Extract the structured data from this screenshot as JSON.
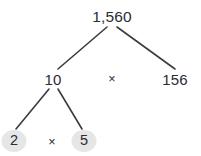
{
  "diagram": {
    "type": "factor-tree",
    "background_color": "#ffffff",
    "line_color": "#3a3a42",
    "text_color": "#2b2b33",
    "leaf_circle_color": "#e6e6e6",
    "nodes": [
      {
        "id": "root",
        "label": "1,560",
        "x": 112,
        "y": 17,
        "style": "plain"
      },
      {
        "id": "ten",
        "label": "10",
        "x": 53,
        "y": 79,
        "style": "plain"
      },
      {
        "id": "mid_op",
        "label": "×",
        "x": 112,
        "y": 79,
        "style": "operator"
      },
      {
        "id": "n156",
        "label": "156",
        "x": 175,
        "y": 79,
        "style": "plain"
      },
      {
        "id": "two",
        "label": "2",
        "x": 14,
        "y": 141,
        "style": "circled"
      },
      {
        "id": "low_op",
        "label": "×",
        "x": 52,
        "y": 142,
        "style": "operator"
      },
      {
        "id": "five",
        "label": "5",
        "x": 84,
        "y": 141,
        "style": "circled"
      }
    ],
    "edges": [
      {
        "id": "root-ten",
        "from": "root",
        "to": "ten",
        "x1": 107,
        "y1": 27,
        "x2": 58,
        "y2": 69
      },
      {
        "id": "root-156",
        "from": "root",
        "to": "n156",
        "x1": 117,
        "y1": 27,
        "x2": 175,
        "y2": 69
      },
      {
        "id": "ten-two",
        "from": "ten",
        "to": "two",
        "x1": 49,
        "y1": 89,
        "x2": 16,
        "y2": 129
      },
      {
        "id": "ten-five",
        "from": "ten",
        "to": "five",
        "x1": 58,
        "y1": 89,
        "x2": 82,
        "y2": 129
      }
    ]
  }
}
